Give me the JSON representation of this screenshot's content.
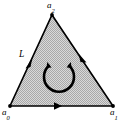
{
  "figure": {
    "type": "oriented-simplex-diagram",
    "background_color": "#ffffff",
    "fill_color": "#cccccc",
    "fill_pattern": "stipple",
    "stroke_color": "#000000",
    "vertices": [
      {
        "id": "a0",
        "label": "a",
        "subscript": "0",
        "x": 10,
        "y": 106,
        "position": "bottom-left"
      },
      {
        "id": "a1",
        "label": "a",
        "subscript": "1",
        "x": 113,
        "y": 106,
        "position": "bottom-right"
      },
      {
        "id": "a2",
        "label": "a",
        "subscript": "2",
        "x": 52,
        "y": 15,
        "position": "apex"
      }
    ],
    "edges": [
      {
        "id": "edge-a0-a1",
        "from": "a0",
        "to": "a1",
        "arrow_at": {
          "x": 58,
          "y": 106
        },
        "direction": "right"
      },
      {
        "id": "edge-a1-a2",
        "from": "a1",
        "to": "a2",
        "arrow_at": {
          "x": 84,
          "y": 59
        },
        "direction": "down-right"
      },
      {
        "id": "edge-a2-a0",
        "from": "a2",
        "to": "a0",
        "arrow_at": {
          "x": 29,
          "y": 64
        },
        "direction": "down-left"
      }
    ],
    "edge_label": {
      "id": "L",
      "text": "L",
      "x": 19,
      "y": 50,
      "attached_to": "edge-a2-a0"
    },
    "orientation_arrow": {
      "shape": "circular-arc",
      "center_x": 59,
      "center_y": 77,
      "radius": 15,
      "opening": "top",
      "arrowheads": 2,
      "sense": "counterclockwise"
    }
  }
}
